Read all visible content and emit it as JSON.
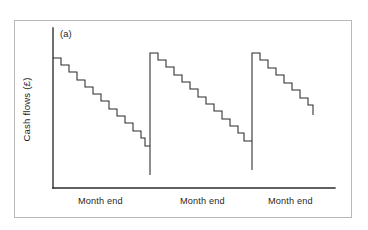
{
  "figure": {
    "panel_label": "(a)",
    "frame_color": "#b9b9b9",
    "line_color": "#2b2b2b",
    "background": "#ffffff"
  },
  "chart_data": {
    "type": "line",
    "title": "",
    "subtitle": "",
    "panel": "(a)",
    "xlabel": "",
    "ylabel": "Cash flows (£)",
    "grid": false,
    "legend": null,
    "axis_ticks_shown": false,
    "x_tick_labels": [
      "Month end",
      "Month end",
      "Month end"
    ],
    "x_tick_label_positions_px": [
      118,
      220,
      308
    ],
    "axis_px": {
      "y_axis_x": 53,
      "y_axis_top": 28,
      "origin_y": 188,
      "x_axis_right": 335
    },
    "cycles": [
      {
        "name": "month-1",
        "peak_y_px": 58,
        "trough_y_px": 175,
        "step_start_x_px": 53,
        "step_width_px": 7.9,
        "step_height_px": 7.3,
        "num_steps": 15,
        "reset_x_px": 150
      },
      {
        "name": "month-2",
        "peak_y_px": 53,
        "trough_y_px": 170,
        "step_start_x_px": 150,
        "step_width_px": 7.9,
        "step_height_px": 7.3,
        "num_steps": 15,
        "reset_x_px": 252
      },
      {
        "name": "month-3",
        "peak_y_px": 53,
        "trough_y_px": 115,
        "step_start_x_px": 252,
        "step_width_px": 7.9,
        "step_height_px": 7.3,
        "num_steps": 8,
        "reset_x_px": null,
        "truncated": true
      }
    ],
    "series": [
      {
        "name": "Cash flows",
        "points_px": [
          [
            53,
            58
          ],
          [
            61,
            58
          ],
          [
            61,
            65
          ],
          [
            69,
            65
          ],
          [
            69,
            72
          ],
          [
            77,
            72
          ],
          [
            77,
            80
          ],
          [
            85,
            80
          ],
          [
            85,
            87
          ],
          [
            93,
            87
          ],
          [
            93,
            94
          ],
          [
            101,
            94
          ],
          [
            101,
            101
          ],
          [
            109,
            101
          ],
          [
            109,
            109
          ],
          [
            117,
            109
          ],
          [
            117,
            116
          ],
          [
            125,
            116
          ],
          [
            125,
            123
          ],
          [
            133,
            123
          ],
          [
            133,
            131
          ],
          [
            141,
            131
          ],
          [
            141,
            138
          ],
          [
            145,
            138
          ],
          [
            145,
            146
          ],
          [
            150,
            146
          ],
          [
            150,
            175
          ],
          [
            150,
            53
          ],
          [
            158,
            53
          ],
          [
            158,
            60
          ],
          [
            166,
            60
          ],
          [
            166,
            67
          ],
          [
            174,
            67
          ],
          [
            174,
            75
          ],
          [
            182,
            75
          ],
          [
            182,
            82
          ],
          [
            190,
            82
          ],
          [
            190,
            89
          ],
          [
            198,
            89
          ],
          [
            198,
            97
          ],
          [
            206,
            97
          ],
          [
            206,
            104
          ],
          [
            214,
            104
          ],
          [
            214,
            111
          ],
          [
            222,
            111
          ],
          [
            222,
            119
          ],
          [
            230,
            119
          ],
          [
            230,
            126
          ],
          [
            238,
            126
          ],
          [
            238,
            133
          ],
          [
            244,
            133
          ],
          [
            244,
            141
          ],
          [
            252,
            141
          ],
          [
            252,
            170
          ],
          [
            252,
            53
          ],
          [
            260,
            53
          ],
          [
            260,
            60
          ],
          [
            268,
            60
          ],
          [
            268,
            68
          ],
          [
            276,
            68
          ],
          [
            276,
            75
          ],
          [
            284,
            75
          ],
          [
            284,
            83
          ],
          [
            292,
            83
          ],
          [
            292,
            90
          ],
          [
            300,
            90
          ],
          [
            300,
            98
          ],
          [
            308,
            98
          ],
          [
            308,
            105
          ],
          [
            313,
            105
          ],
          [
            313,
            115
          ]
        ]
      }
    ]
  },
  "axes": {
    "ylabel": "Cash flows (£)",
    "x_labels": [
      {
        "text": "Month end",
        "left_px": 78
      },
      {
        "text": "Month end",
        "left_px": 180
      },
      {
        "text": "Month end",
        "left_px": 268
      }
    ]
  }
}
